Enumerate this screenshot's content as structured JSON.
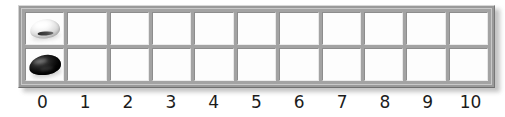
{
  "grid": {
    "columns": 11,
    "rows": 2,
    "frame_color": "#9a9a9a",
    "cell_color": "#fdfdfd",
    "gridline_color": "#8d8d8d"
  },
  "axis": {
    "labels": [
      "0",
      "1",
      "2",
      "3",
      "4",
      "5",
      "6",
      "7",
      "8",
      "9",
      "10"
    ]
  },
  "tokens": [
    {
      "row": 0,
      "column": 0,
      "kind": "light-bean",
      "color": "#f4f4f4",
      "label": "white bean"
    },
    {
      "row": 1,
      "column": 0,
      "kind": "dark-bean",
      "color": "#111111",
      "label": "black bean"
    }
  ],
  "cells": {
    "row0": [
      "light-bean",
      "",
      "",
      "",
      "",
      "",
      "",
      "",
      "",
      "",
      ""
    ],
    "row1": [
      "dark-bean",
      "",
      "",
      "",
      "",
      "",
      "",
      "",
      "",
      "",
      ""
    ]
  }
}
